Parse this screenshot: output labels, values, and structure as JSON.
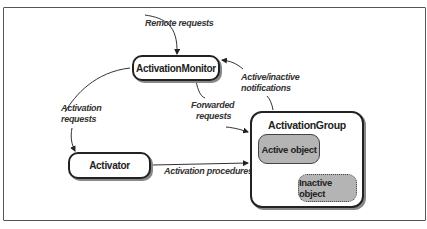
{
  "diagram": {
    "nodes": {
      "monitor": "ActivationMonitor",
      "activator": "Activator",
      "group": "ActivationGroup",
      "active_object": "Active object",
      "inactive_object": "Inactive object"
    },
    "edges": {
      "remote_requests": "Remote requests",
      "activation_requests_1": "Activation",
      "activation_requests_2": "requests",
      "forwarded_requests_1": "Forwarded",
      "forwarded_requests_2": "requests",
      "notifications_1": "Active/inactive",
      "notifications_2": "notifications",
      "activation_procedures": "Activation procedures"
    }
  }
}
